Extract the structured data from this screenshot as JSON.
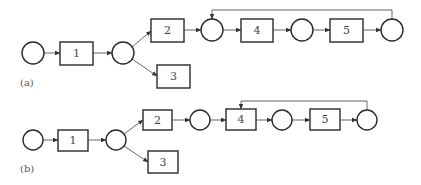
{
  "figure": {
    "panels": [
      {
        "label": "(a)",
        "tasks": [
          "1",
          "2",
          "3",
          "4",
          "5"
        ],
        "feedback": "last state loops back to the state before task 4"
      },
      {
        "label": "(b)",
        "tasks": [
          "1",
          "2",
          "3",
          "4",
          "5"
        ],
        "feedback": "last state loops back to task 4"
      }
    ]
  },
  "a": {
    "label": "(a)",
    "box1": "1",
    "box2": "2",
    "box3": "3",
    "box4": "4",
    "box5": "5"
  },
  "b": {
    "label": "(b)",
    "box1": "1",
    "box2": "2",
    "box3": "3",
    "box4": "4",
    "box5": "5"
  }
}
